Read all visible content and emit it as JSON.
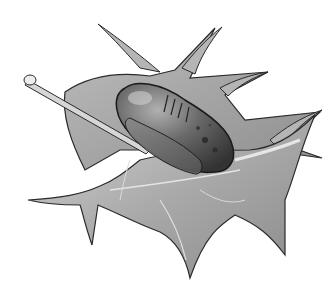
{
  "image": {
    "description": "Grayscale illustration of a spiky holly leaf with a dark mottled insect pupa resting on it",
    "subjects": [
      "holly-leaf",
      "pupa"
    ],
    "colors": {
      "background": "#ffffff",
      "leaf_light": "#c9c9c9",
      "leaf_mid": "#a8a8a8",
      "leaf_dark": "#7a7a7a",
      "outline": "#2a2a2a",
      "pupa_dark": "#3a3a3a",
      "pupa_mid": "#6e6e6e",
      "pupa_light": "#a0a0a0",
      "stem": "#d0d0d0"
    }
  }
}
